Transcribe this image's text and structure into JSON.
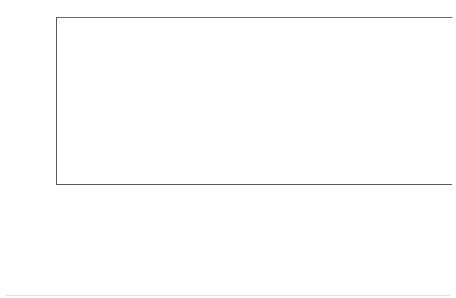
{
  "chart_data": {
    "type": "scatter",
    "title": "",
    "subtitle": "",
    "xlabel": "",
    "ylabel": "Multivariable Odds Ratio (95% CI)",
    "yscale": "log2",
    "ylim": [
      0.1,
      25.6
    ],
    "ytick_labels": [
      "25.6",
      "12.8",
      "6.4",
      "3.2",
      "1.6",
      "0.8",
      "0.4",
      "0.2",
      "0.1"
    ],
    "ytick_values": [
      25.6,
      12.8,
      6.4,
      3.2,
      1.6,
      0.8,
      0.4,
      0.2,
      0.1
    ],
    "reference_line": 1.0,
    "grid": false,
    "legend": "none",
    "marker_shape": "diamond",
    "accent_color": "#1b8ccd",
    "axis_color": "#5a5a5a",
    "categories": [
      "Venous Thrombosis",
      "Arterial Thrombosis",
      "AMI",
      "Stroke",
      "Mortality"
    ],
    "groups": [
      {
        "name": "Thombotic Thrombocytopenic Pupura",
        "points": [
          {
            "category": "Venous Thrombosis",
            "value": 1.1,
            "label": "1.1",
            "ci_low": 0.55,
            "ci_high": 2.1
          },
          {
            "category": "Arterial Thrombosis",
            "value": 5.8,
            "label": "5.8",
            "ci_low": 1.45,
            "ci_high": 24.0
          },
          {
            "category": "AMI",
            "value": 2.0,
            "label": "2.0",
            "ci_low": 1.15,
            "ci_high": 3.5
          },
          {
            "category": "Stroke",
            "value": 1.5,
            "label": "1.5",
            "ci_low": 0.95,
            "ci_high": 2.5
          },
          {
            "category": "Mortality",
            "value": 2.0,
            "label": "2.0",
            "ci_low": 1.25,
            "ci_high": 3.3
          }
        ]
      },
      {
        "name": "Heparin Induced Thrombocytopenia",
        "points": [
          {
            "category": "Venous Thrombosis",
            "value": 0.8,
            "label": "0.8",
            "ci_low": 0.45,
            "ci_high": 1.55
          },
          {
            "category": "Arterial Thrombosis",
            "value": 3.4,
            "label": "3.4",
            "ci_low": 1.05,
            "ci_high": 8.6
          },
          {
            "category": "AMI",
            "value": 1.9,
            "label": "1.9",
            "ci_low": 0.34,
            "ci_high": 12.0
          },
          {
            "category": "Stroke",
            "value": 0.5,
            "label": "0.5",
            "ci_low": 0.15,
            "ci_high": 1.6
          },
          {
            "category": "Mortality",
            "value": 5.2,
            "label": "5.2",
            "ci_low": 2.9,
            "ci_high": 10.5
          }
        ]
      },
      {
        "name": "Immune Thrombocytopenic Pupura",
        "points": [
          {
            "category": "Venous Thrombosis",
            "value": 1.3,
            "label": "1.3",
            "ci_low": 0.85,
            "ci_high": 1.95
          },
          {
            "category": "Arterial Thrombosis",
            "value": 0.3,
            "label": "0.3",
            "ci_low": 0.11,
            "ci_high": 1.55
          },
          {
            "category": "AMI",
            "value": 1.3,
            "label": "1.3",
            "ci_low": 0.78,
            "ci_high": 2.4
          },
          {
            "category": "Stroke",
            "value": 1.9,
            "label": "1.9",
            "ci_low": 1.25,
            "ci_high": 2.6
          },
          {
            "category": "Mortality",
            "value": 1.1,
            "label": "1.1",
            "ci_low": 0.85,
            "ci_high": 1.45
          }
        ]
      }
    ]
  }
}
